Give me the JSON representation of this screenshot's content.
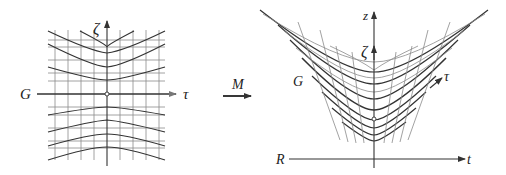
{
  "figure": {
    "left_panel": {
      "vertical_axis_label": "ζ",
      "horizontal_axis_left_label": "G",
      "horizontal_axis_right_label": "τ",
      "origin_marker": "open-circle"
    },
    "mapping": {
      "label": "M",
      "icon": "right-arrow-icon"
    },
    "right_panel": {
      "vertical_axis_label": "z",
      "inner_vertical_axis_label": "ζ",
      "curve_label_left": "G",
      "curve_label_right": "τ",
      "horizontal_axis_left_label": "R",
      "horizontal_axis_right_label": "t",
      "origin_marker": "open-circle"
    },
    "colors": {
      "ink": "#333333",
      "grid": "#8a8a8a",
      "background": "#ffffff"
    }
  }
}
